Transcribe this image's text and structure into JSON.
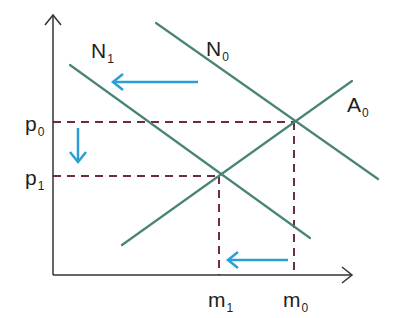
{
  "diagram": {
    "type": "supply-demand shift diagram",
    "colors": {
      "axis": "#333333",
      "curve": "#4a8478",
      "guide": "#6b2d46",
      "arrow": "#2a9fd6"
    },
    "axes": {
      "y_axis": {
        "x": 53,
        "y_top": 15,
        "y_bottom": 275
      },
      "x_axis": {
        "y": 275,
        "x_left": 53,
        "x_right": 352
      }
    },
    "curves": [
      {
        "id": "N0",
        "label": "N",
        "subscript": "0",
        "x1": 156,
        "y1": 23,
        "x2": 378,
        "y2": 179,
        "label_x": 206,
        "label_y": 38
      },
      {
        "id": "N1",
        "label": "N",
        "subscript": "1",
        "x1": 70,
        "y1": 65,
        "x2": 310,
        "y2": 238,
        "label_x": 91,
        "label_y": 40
      },
      {
        "id": "A0",
        "label": "A",
        "subscript": "0",
        "x1": 122,
        "y1": 245,
        "x2": 352,
        "y2": 81,
        "label_x": 347,
        "label_y": 94
      }
    ],
    "equilibria": [
      {
        "id": "E0",
        "x": 294,
        "y": 122,
        "price_label": "p",
        "price_sub": "0",
        "qty_label": "m",
        "qty_sub": "0"
      },
      {
        "id": "E1",
        "x": 219,
        "y": 176,
        "price_label": "p",
        "price_sub": "1",
        "qty_label": "m",
        "qty_sub": "1"
      }
    ],
    "y_tick_labels": [
      {
        "text": "p",
        "sub": "0",
        "x": 25,
        "y": 113
      },
      {
        "text": "p",
        "sub": "1",
        "x": 25,
        "y": 167
      }
    ],
    "x_tick_labels": [
      {
        "text": "m",
        "sub": "1",
        "x": 208,
        "y": 289
      },
      {
        "text": "m",
        "sub": "0",
        "x": 283,
        "y": 289
      }
    ],
    "arrows": [
      {
        "id": "demand-shift-arrow",
        "x1": 198,
        "y1": 82,
        "x2": 113,
        "y2": 82,
        "direction": "left"
      },
      {
        "id": "price-drop-arrow",
        "x1": 78,
        "y1": 128,
        "x2": 78,
        "y2": 162,
        "direction": "down"
      },
      {
        "id": "quantity-drop-arrow",
        "x1": 288,
        "y1": 260,
        "x2": 228,
        "y2": 260,
        "direction": "left"
      }
    ]
  }
}
